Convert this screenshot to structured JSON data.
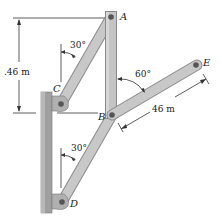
{
  "diagram": {
    "points": {
      "A": "A",
      "B": "B",
      "C": "C",
      "D": "D",
      "E": "E"
    },
    "angles": {
      "upper_30": "30°",
      "lower_30": "30°",
      "angle_60": "60°"
    },
    "dimensions": {
      "vertical": ".46 m",
      "inclined": "46 m"
    },
    "colors": {
      "member_fill": "#c4c4c4",
      "member_edge": "#8a8a8a",
      "wall_fill": "#9c9c9c",
      "pin": "#555555",
      "line": "#333333"
    }
  }
}
